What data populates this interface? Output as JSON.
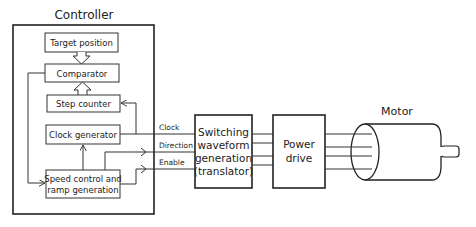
{
  "controller": {
    "title": "Controller",
    "blocks": {
      "target": "Target position",
      "comparator": "Comparator",
      "step_counter": "Step counter",
      "clock_generator": "Clock generator",
      "speed_control_line1": "Speed control and",
      "speed_control_line2": "ramp generation"
    }
  },
  "signals": {
    "clock": "Clock",
    "direction": "Direction",
    "enable": "Enable"
  },
  "translator": {
    "line1": "Switching",
    "line2": "waveform",
    "line3": "generation",
    "line4": "(translator)"
  },
  "power_drive": {
    "line1": "Power",
    "line2": "drive"
  },
  "motor": {
    "label": "Motor"
  }
}
